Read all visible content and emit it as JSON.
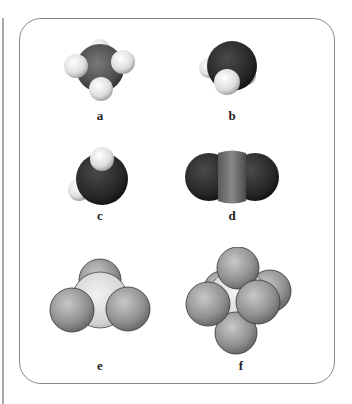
{
  "figure": {
    "panels": [
      {
        "id": "a",
        "label": "a",
        "description": "tetrahedral molecule: dark gray central atom with four white atoms"
      },
      {
        "id": "b",
        "label": "b",
        "description": "bent molecule: black central atom with two white atoms"
      },
      {
        "id": "c",
        "label": "c",
        "description": "bent molecule: black central atom with two white atoms (rotated view)"
      },
      {
        "id": "d",
        "label": "d",
        "description": "linear molecule: gray central atom between two black atoms"
      },
      {
        "id": "e",
        "label": "e",
        "description": "trigonal pyramidal molecule: light central atom with three gray atoms"
      },
      {
        "id": "f",
        "label": "f",
        "description": "octahedral molecule: light central atom with six gray atoms"
      }
    ]
  },
  "colors": {
    "white_atom": "#e8e8e8",
    "black_atom": "#2a2a2a",
    "gray_atom": "#8c8c8c",
    "light_atom": "#d4d4d4",
    "border": "#8a8a8a"
  }
}
